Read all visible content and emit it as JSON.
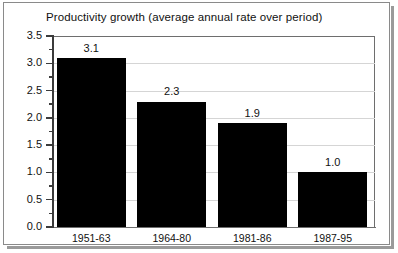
{
  "chart_data": {
    "type": "bar",
    "title": "Productivity growth (average annual rate over period)",
    "xlabel": "",
    "ylabel": "",
    "categories": [
      "1951-63",
      "1964-80",
      "1981-86",
      "1987-95"
    ],
    "values": [
      3.1,
      2.3,
      1.9,
      1.0
    ],
    "value_labels": [
      "3.1",
      "2.3",
      "1.9",
      "1.0"
    ],
    "ylim": [
      0.0,
      3.5
    ],
    "ytick_labels": [
      "0.0",
      "0.5",
      "1.0",
      "1.5",
      "2.0",
      "2.5",
      "3.0",
      "3.5"
    ],
    "ytick_values": [
      0.0,
      0.5,
      1.0,
      1.5,
      2.0,
      2.5,
      3.0,
      3.5
    ],
    "minor_tick_values": [
      0.25,
      0.75,
      1.25,
      1.75,
      2.25,
      2.75,
      3.25
    ],
    "grid": true,
    "grid_axis": "y",
    "legend": false,
    "bar_color": "#000000",
    "grid_color": "#d5d5d5",
    "axis_color": "#3b3b3b",
    "frame_color": "#8a8a8a",
    "background_color": "#ffffff"
  }
}
